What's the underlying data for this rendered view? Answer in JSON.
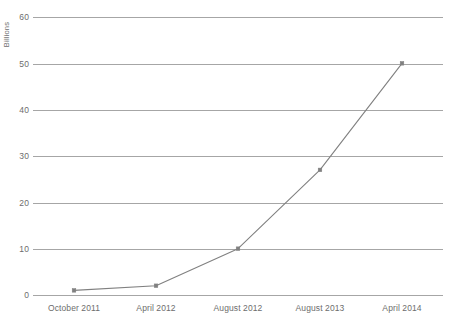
{
  "chart_data": {
    "type": "line",
    "title": "",
    "xlabel": "",
    "ylabel": "Billions",
    "categories": [
      "October 2011",
      "April 2012",
      "August 2012",
      "August 2013",
      "April 2014"
    ],
    "values": [
      1,
      2,
      10,
      27,
      50
    ],
    "series": [
      {
        "name": "",
        "values": [
          1,
          2,
          10,
          27,
          50
        ]
      }
    ],
    "ylim": [
      0,
      60
    ],
    "yticks": [
      0,
      10,
      20,
      30,
      40,
      50,
      60
    ],
    "ytick_labels": [
      "0",
      "10",
      "20",
      "30",
      "40",
      "50",
      "60"
    ],
    "grid": "horizontal",
    "legend": "none",
    "markers": "square",
    "line_color": "#808080",
    "grid_color": "#a6a6a6",
    "text_color": "#6d6d6d",
    "background_color": "#ffffff"
  },
  "axis": {
    "y_title": "Billions",
    "y_labels": [
      "60",
      "50",
      "40",
      "30",
      "20",
      "10",
      "0"
    ],
    "x_labels": [
      "October 2011",
      "April 2012",
      "August 2012",
      "August 2013",
      "April 2014"
    ]
  }
}
